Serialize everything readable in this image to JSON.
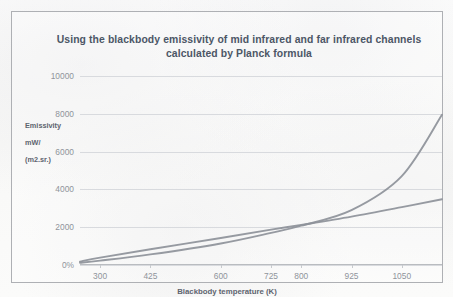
{
  "chart_data": {
    "type": "line",
    "title": "Using the blackbody emissivity of mid infrared and far infrared channels calculated by Planck formula",
    "title_line1": "Using the blackbody emissivity of mid infrared and far infrared channels",
    "title_line2": "calculated by Planck formula",
    "xlabel": "Blackbody temperature  (K)",
    "ylabel": "Emissivity\nmW/\n(m2.sr.)",
    "ylabel_lines": [
      "Emissivity",
      "mW/",
      "(m2.sr.)"
    ],
    "xticklabels": [
      "300",
      "425",
      "600",
      "725",
      "800",
      "925",
      "1050"
    ],
    "x": [
      300,
      425,
      600,
      725,
      800,
      925,
      1050
    ],
    "yticklabels": [
      "0%",
      "2000",
      "4000",
      "6000",
      "8000",
      "10000"
    ],
    "yticks": [
      0,
      2000,
      4000,
      6000,
      8000,
      10000
    ],
    "ylim": [
      0,
      10000
    ],
    "xlim": [
      250,
      1150
    ],
    "grid": true,
    "legend": "none",
    "line_color": "#8d9199",
    "grid_color": "#d8dade",
    "series": [
      {
        "name": "mid infrared",
        "comment": "near-linear series, ends about 3500",
        "x": [
          250,
          300,
          425,
          600,
          725,
          800,
          925,
          1050,
          1150
        ],
        "values": [
          180,
          390,
          830,
          1430,
          1870,
          2120,
          2560,
          3060,
          3480
        ]
      },
      {
        "name": "far infrared",
        "comment": "exponential series crossing the linear one near 925 K, ends about 8000",
        "x": [
          250,
          300,
          425,
          600,
          725,
          800,
          925,
          1050,
          1150
        ],
        "values": [
          120,
          230,
          560,
          1140,
          1700,
          2080,
          2900,
          4700,
          7950
        ]
      }
    ],
    "crossing_point": {
      "x": 960,
      "y": 2650
    }
  },
  "colors": {
    "frame": "#aeb0b4",
    "title": "#4c5666",
    "axis_text": "#8f949b",
    "axis_title": "#5d646e",
    "series": "#8d9199",
    "background": "#fbfbfa"
  }
}
